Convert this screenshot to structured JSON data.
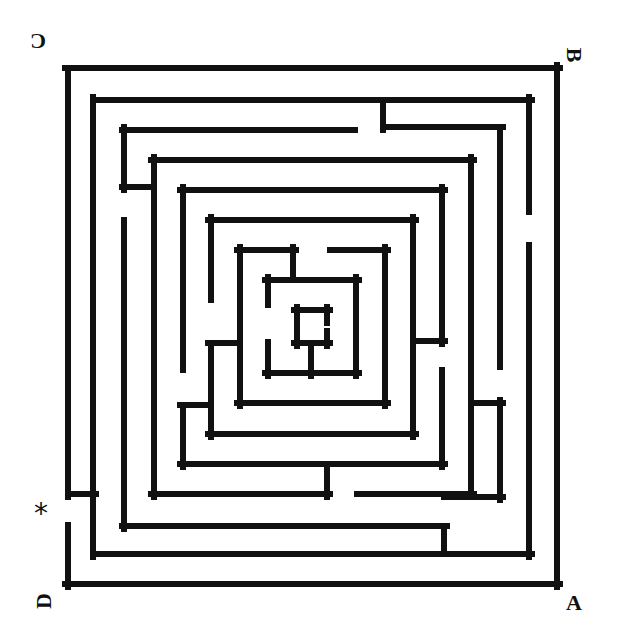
{
  "maze": {
    "wall_color": "#111111",
    "background_color": "#ffffff",
    "wall_thickness": 6,
    "walls": [
      [
        65,
        68,
        560,
        68
      ],
      [
        557,
        65,
        557,
        587
      ],
      [
        65,
        584,
        560,
        584
      ],
      [
        68,
        68,
        68,
        497
      ],
      [
        68,
        494,
        96,
        494
      ],
      [
        68,
        525,
        68,
        587
      ],
      [
        93,
        100,
        532,
        100
      ],
      [
        93,
        97,
        93,
        557
      ],
      [
        93,
        554,
        532,
        554
      ],
      [
        529,
        97,
        529,
        212
      ],
      [
        529,
        245,
        529,
        557
      ],
      [
        383,
        100,
        383,
        130
      ],
      [
        383,
        127,
        503,
        127
      ],
      [
        500,
        127,
        500,
        367
      ],
      [
        122,
        130,
        355,
        130
      ],
      [
        124,
        127,
        124,
        190
      ],
      [
        122,
        187,
        151,
        187
      ],
      [
        124,
        220,
        124,
        529
      ],
      [
        122,
        526,
        447,
        526
      ],
      [
        444,
        526,
        444,
        554
      ],
      [
        444,
        497,
        503,
        497
      ],
      [
        500,
        400,
        500,
        500
      ],
      [
        474,
        403,
        503,
        403
      ],
      [
        151,
        160,
        474,
        160
      ],
      [
        154,
        157,
        154,
        497
      ],
      [
        151,
        494,
        330,
        494
      ],
      [
        327,
        467,
        327,
        497
      ],
      [
        357,
        494,
        474,
        494
      ],
      [
        471,
        157,
        471,
        497
      ],
      [
        180,
        190,
        445,
        190
      ],
      [
        183,
        187,
        183,
        370
      ],
      [
        442,
        187,
        442,
        344
      ],
      [
        416,
        341,
        445,
        341
      ],
      [
        442,
        370,
        442,
        467
      ],
      [
        180,
        464,
        445,
        464
      ],
      [
        183,
        405,
        183,
        467
      ],
      [
        180,
        405,
        211,
        405
      ],
      [
        208,
        220,
        416,
        220
      ],
      [
        211,
        217,
        211,
        300
      ],
      [
        208,
        343,
        237,
        343
      ],
      [
        211,
        343,
        211,
        437
      ],
      [
        208,
        434,
        416,
        434
      ],
      [
        413,
        217,
        413,
        437
      ],
      [
        237,
        250,
        296,
        250
      ],
      [
        240,
        247,
        240,
        406
      ],
      [
        293,
        247,
        293,
        280
      ],
      [
        330,
        250,
        388,
        250
      ],
      [
        385,
        247,
        385,
        406
      ],
      [
        237,
        403,
        388,
        403
      ],
      [
        265,
        280,
        359,
        280
      ],
      [
        268,
        277,
        268,
        305
      ],
      [
        268,
        342,
        268,
        376
      ],
      [
        265,
        373,
        359,
        373
      ],
      [
        356,
        277,
        356,
        376
      ],
      [
        311,
        343,
        311,
        376
      ],
      [
        294,
        310,
        330,
        310
      ],
      [
        297,
        307,
        297,
        346
      ],
      [
        294,
        343,
        330,
        343
      ],
      [
        327,
        307,
        327,
        323
      ],
      [
        327,
        331,
        327,
        346
      ]
    ]
  },
  "labels": {
    "top_left": "C",
    "top_right": "B",
    "bottom_right": "A",
    "bottom_left": "D",
    "entrance_marker": "*"
  }
}
